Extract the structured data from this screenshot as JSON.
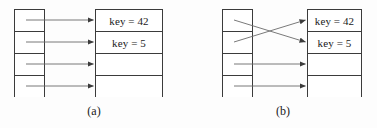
{
  "figure": {
    "type": "diagram",
    "background_color": "#fdfdfd",
    "line_color": "#3b3b3b",
    "arrow_color": "#555555",
    "text_color": "#1a1a1a"
  },
  "panels": [
    {
      "id": "a",
      "caption": "(a)",
      "index_table": {
        "name": "index-block",
        "slot_count": 4,
        "slots": [
          {
            "label": ""
          },
          {
            "label": ""
          },
          {
            "label": ""
          },
          {
            "label": ""
          }
        ]
      },
      "bucket_table": {
        "name": "data-block",
        "row_count": 4,
        "rows": [
          {
            "label": "key = 42"
          },
          {
            "label": "key = 5"
          },
          {
            "label": ""
          },
          {
            "label": ""
          }
        ]
      },
      "pointers": [
        {
          "from_slot": 0,
          "to_row": 0,
          "style": "straight"
        },
        {
          "from_slot": 1,
          "to_row": 1,
          "style": "straight"
        },
        {
          "from_slot": 2,
          "to_row": 2,
          "style": "straight"
        },
        {
          "from_slot": 3,
          "to_row": 3,
          "style": "straight"
        }
      ]
    },
    {
      "id": "b",
      "caption": "(b)",
      "index_table": {
        "name": "index-block",
        "slot_count": 4,
        "slots": [
          {
            "label": ""
          },
          {
            "label": ""
          },
          {
            "label": ""
          },
          {
            "label": ""
          }
        ]
      },
      "bucket_table": {
        "name": "data-block",
        "row_count": 4,
        "rows": [
          {
            "label": "key = 42"
          },
          {
            "label": "key = 5"
          },
          {
            "label": ""
          },
          {
            "label": ""
          }
        ]
      },
      "pointers": [
        {
          "from_slot": 0,
          "to_row": 1,
          "style": "crossed"
        },
        {
          "from_slot": 1,
          "to_row": 0,
          "style": "crossed"
        },
        {
          "from_slot": 2,
          "to_row": 2,
          "style": "straight"
        },
        {
          "from_slot": 3,
          "to_row": 3,
          "style": "straight"
        }
      ]
    }
  ]
}
